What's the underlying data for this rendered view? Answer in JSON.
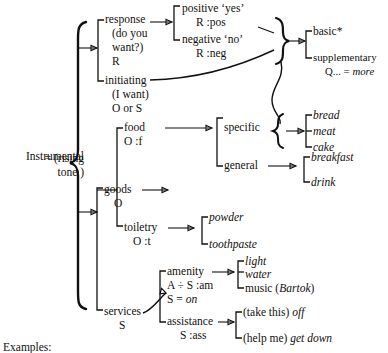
{
  "figure": {
    "type": "system-network-diagram",
    "caption": "Examples:",
    "root": {
      "label": "Instrumental",
      "equals_line1": "= (rising",
      "equals_line2": "tone )"
    },
    "nodes": {
      "response": {
        "line1": "response",
        "line2": "(do you",
        "line3": "want?)",
        "line4": "R"
      },
      "initiating": {
        "line1": "initiating",
        "line2": "(I want)",
        "line3": "O or S"
      },
      "positive": {
        "line1": "positive ‘yes’",
        "line2": "R :pos"
      },
      "negative": {
        "line1": "negative ‘no’",
        "line2": "R :neg"
      },
      "basic": {
        "line1": "basic*"
      },
      "supplementary": {
        "line1": "supplementary",
        "line2": "Q... = more",
        "line2_italic": "more"
      },
      "goods": {
        "line1": "goods",
        "line2": "O"
      },
      "services": {
        "line1": "services",
        "line2": "S"
      },
      "food": {
        "line1": "food",
        "line2": "O :f"
      },
      "toiletry": {
        "line1": "toiletry",
        "line2": "O :t"
      },
      "specific": {
        "line1": "specific"
      },
      "general": {
        "line1": "general"
      },
      "amenity": {
        "line1": "amenity",
        "line2": "A ÷ S :am",
        "line3": "S = on"
      },
      "assistance": {
        "line1": "assistance",
        "line2": "S :ass"
      }
    },
    "leaves": {
      "bread": "bread",
      "meat": "meat",
      "cake": "cake",
      "breakfast": "breakfast",
      "drink": "drink",
      "powder": "powder",
      "toothpaste": "toothpaste",
      "light": "light",
      "water": "water",
      "music_plain": "music (",
      "music_italic": "Bartok",
      "music_close": ")",
      "take_this_plain": "(take this) ",
      "take_this_italic": "off",
      "help_me_plain": "(help me) ",
      "help_me_italic": "get down"
    }
  }
}
